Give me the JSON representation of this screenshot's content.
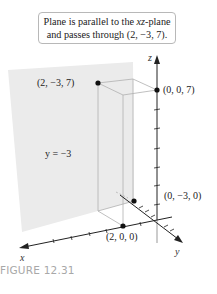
{
  "figure": {
    "caption": "FIGURE 12.31",
    "callout": {
      "line1_pre": "Plane is parallel to the ",
      "line1_var": "xz",
      "line1_post": "-plane",
      "line2": "and passes through (2, −3, 7)."
    },
    "plane_label": "y = −3",
    "axes": {
      "x": "x",
      "y": "y",
      "z": "z"
    },
    "points": [
      {
        "id": "p1",
        "label": "(2, −3, 7)"
      },
      {
        "id": "p2",
        "label": "(0, 0, 7)"
      },
      {
        "id": "p3",
        "label": "(0, −3, 0)"
      },
      {
        "id": "p4",
        "label": "(2, 0, 0)"
      }
    ],
    "colors": {
      "plane": "#ebebeb",
      "axis": "#222222",
      "box": "#b0b0b0",
      "callout_border": "#b8b8b8",
      "caption": "#a8a8a8"
    }
  }
}
